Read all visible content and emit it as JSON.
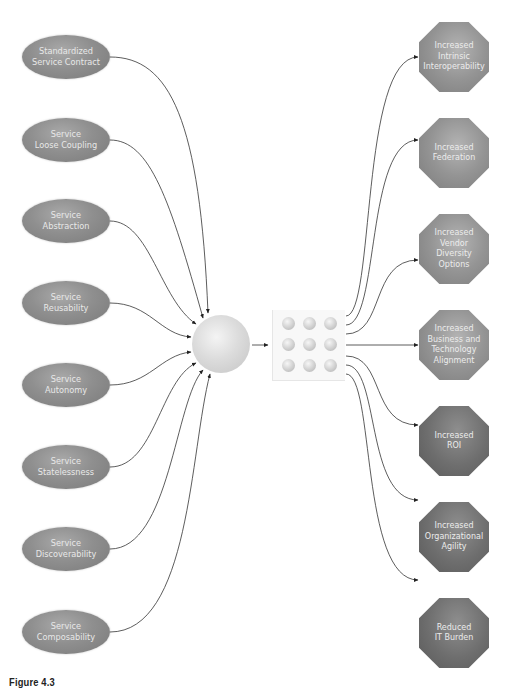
{
  "figure": {
    "caption": "Figure 4.3",
    "center_nodes": {
      "hub": "sphere",
      "grid": "3x3 grid of spheres"
    },
    "principles": [
      {
        "line1": "Standardized",
        "line2": "Service Contract"
      },
      {
        "line1": "Service",
        "line2": "Loose Coupling"
      },
      {
        "line1": "Service",
        "line2": "Abstraction"
      },
      {
        "line1": "Service",
        "line2": "Reusability"
      },
      {
        "line1": "Service",
        "line2": "Autonomy"
      },
      {
        "line1": "Service",
        "line2": "Statelessness"
      },
      {
        "line1": "Service",
        "line2": "Discoverability"
      },
      {
        "line1": "Service",
        "line2": "Composability"
      }
    ],
    "goals": [
      {
        "lines": [
          "Increased",
          "Intrinsic",
          "Interoperability"
        ]
      },
      {
        "lines": [
          "Increased",
          "Federation"
        ]
      },
      {
        "lines": [
          "Increased",
          "Vendor",
          "Diversity",
          "Options"
        ]
      },
      {
        "lines": [
          "Increased",
          "Business and",
          "Technology",
          "Alignment"
        ]
      },
      {
        "lines": [
          "Increased",
          "ROI"
        ]
      },
      {
        "lines": [
          "Increased",
          "Organizational",
          "Agility"
        ]
      },
      {
        "lines": [
          "Reduced",
          "IT Burden"
        ]
      }
    ]
  }
}
